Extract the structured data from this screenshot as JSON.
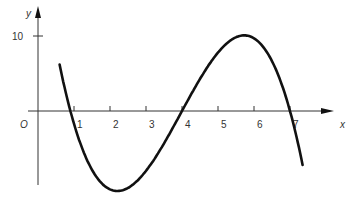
{
  "chart_data": {
    "type": "line",
    "title": "",
    "xlabel": "x",
    "ylabel": "y",
    "origin_label": "O",
    "x_ticks": [
      1,
      2,
      3,
      4,
      5,
      6,
      7
    ],
    "y_ticks": [
      10
    ],
    "xlim": [
      0,
      7.8
    ],
    "ylim": [
      -11,
      10.5
    ],
    "grid": false,
    "series": [
      {
        "name": "cubic curve",
        "description": "cubic with roots near x=0.9, 4, 7; max ~10.5 at x~2.3; min ~-10.7 at x~5.7",
        "x": [
          0.6,
          0.9,
          1.5,
          2.0,
          2.3,
          2.8,
          3.5,
          4.0,
          4.5,
          5.0,
          5.5,
          5.7,
          6.0,
          6.5,
          7.0,
          7.35
        ],
        "y": [
          -8.7,
          0,
          7.2,
          10.0,
          10.5,
          9.3,
          4.7,
          0,
          -4.8,
          -8.8,
          -10.6,
          -10.7,
          -10.2,
          -6.2,
          0,
          5.0
        ]
      }
    ],
    "color": "#111111"
  }
}
